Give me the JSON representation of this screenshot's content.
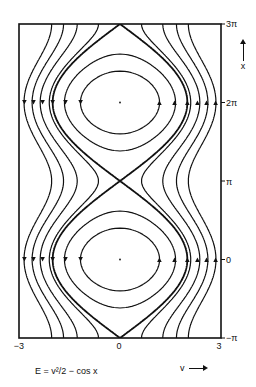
{
  "figure": {
    "formula": "E = v²/2 − cos x",
    "x_axis_label": "x",
    "v_axis_label": "v",
    "y_ticks": [
      {
        "label": "3π",
        "value": 9.42478
      },
      {
        "label": "2π",
        "value": 6.28319
      },
      {
        "label": "π",
        "value": 3.14159
      },
      {
        "label": "0",
        "value": 0
      },
      {
        "label": "−π",
        "value": -3.14159
      }
    ],
    "v_ticks": [
      {
        "label": "−3",
        "value": -3
      },
      {
        "label": "0",
        "value": 0
      },
      {
        "label": "3",
        "value": 3
      }
    ],
    "frame": {
      "left": 19,
      "right": 221,
      "top": 24,
      "bottom": 338,
      "v_min": -3,
      "v_max": 3,
      "x_min": -3.14159,
      "x_max": 9.42478
    },
    "stroke_color": "#111111",
    "closed_orbit_energies": [
      -0.31,
      0.36
    ],
    "separatrix_energy": 1.0,
    "open_orbit_vmin_at_pi": [
      1.35,
      1.71,
      2.1,
      2.37,
      2.61,
      2.85
    ],
    "fixed_points": [
      {
        "v": 0,
        "x": 0
      },
      {
        "v": 0,
        "x": 6.28319
      }
    ],
    "arrow_levels_x": [
      0,
      6.28319
    ],
    "arrow_v_left": [
      -2.84,
      -2.57,
      -2.3,
      -2.0,
      -1.62,
      -1.17
    ],
    "arrow_v_right": [
      1.17,
      1.62,
      2.0,
      2.3,
      2.57,
      2.84
    ]
  }
}
